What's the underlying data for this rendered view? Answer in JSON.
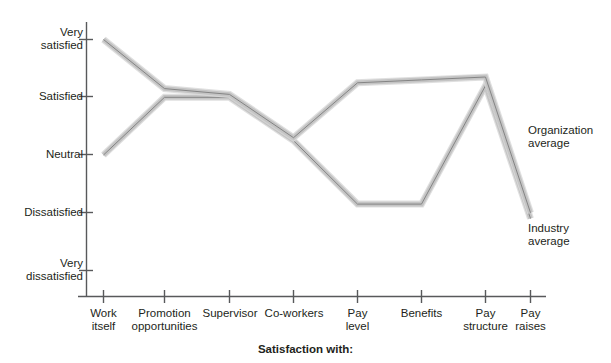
{
  "chart_data": {
    "type": "line",
    "title": "",
    "xlabel": "Satisfaction with:",
    "ylabel": "",
    "categories": [
      "Work itself",
      "Promotion opportunities",
      "Supervisor",
      "Co-workers",
      "Pay level",
      "Benefits",
      "Pay structure",
      "Pay raises"
    ],
    "y_tick_labels": [
      "Very satisfied",
      "Satisfied",
      "Neutral",
      "Dissatisfied",
      "Very dissatisfied"
    ],
    "y_tick_values": [
      5,
      4,
      3,
      2,
      1
    ],
    "ylim": [
      1,
      5
    ],
    "grid": false,
    "legend_position": "right-inline",
    "series": [
      {
        "name": "Organization average",
        "values": [
          5.0,
          4.15,
          4.05,
          3.3,
          4.25,
          4.3,
          4.35,
          2.0
        ]
      },
      {
        "name": "Industry average",
        "values": [
          3.0,
          4.0,
          4.0,
          3.25,
          2.15,
          2.15,
          4.2,
          1.9
        ]
      }
    ],
    "colors": {
      "line_fill": "#c0c0c0",
      "line_edge": "#7f7f7f",
      "axis": "#58595b",
      "text": "#231f20"
    }
  },
  "y_axis": {
    "labels": [
      {
        "line1": "Very",
        "line2": "satisfied"
      },
      {
        "line1": "Satisfied",
        "line2": ""
      },
      {
        "line1": "Neutral",
        "line2": ""
      },
      {
        "line1": "Dissatisfied",
        "line2": ""
      },
      {
        "line1": "Very",
        "line2": "dissatisfied"
      }
    ]
  },
  "x_axis": {
    "title": "Satisfaction with:",
    "labels": [
      {
        "line1": "Work",
        "line2": "itself"
      },
      {
        "line1": "Promotion",
        "line2": "opportunities"
      },
      {
        "line1": "Supervisor",
        "line2": ""
      },
      {
        "line1": "Co-workers",
        "line2": ""
      },
      {
        "line1": "Pay",
        "line2": "level"
      },
      {
        "line1": "Benefits",
        "line2": ""
      },
      {
        "line1": "Pay",
        "line2": "structure"
      },
      {
        "line1": "Pay",
        "line2": "raises"
      }
    ]
  },
  "legend": {
    "organization": {
      "line1": "Organization",
      "line2": "average"
    },
    "industry": {
      "line1": "Industry",
      "line2": "average"
    }
  }
}
